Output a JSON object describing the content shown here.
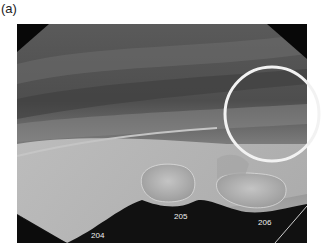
{
  "figure": {
    "panel_label": "(a)",
    "image_description": "Dental radiograph, lateral view of maxillary premolars with circled region of interest",
    "annotation": {
      "shape": "circle",
      "color": "#f2f2f2",
      "center": [
        272,
        114
      ],
      "radius": 47
    },
    "tooth_labels": [
      {
        "id": "204",
        "text": "204"
      },
      {
        "id": "205",
        "text": "205"
      },
      {
        "id": "206",
        "text": "206"
      }
    ]
  }
}
